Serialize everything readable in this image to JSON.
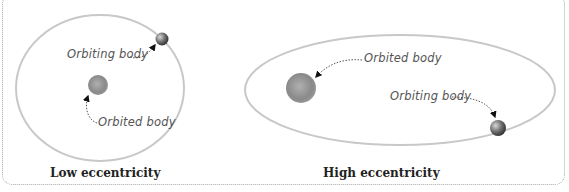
{
  "diagrams": {
    "low": {
      "caption": "Low eccentricity",
      "orbiting_label": "Orbiting body",
      "orbited_label": "Orbited body"
    },
    "high": {
      "caption": "High eccentricity",
      "orbiting_label": "Orbiting body",
      "orbited_label": "Orbited body"
    }
  },
  "colors": {
    "orbit": "#c8c8c8",
    "border": "#a8a8a8",
    "caption": "#222222",
    "label": "#555555"
  }
}
